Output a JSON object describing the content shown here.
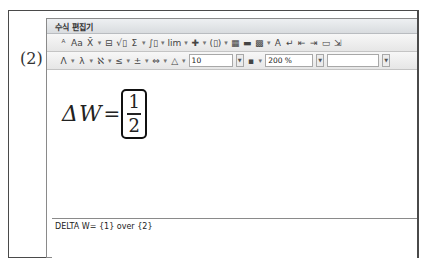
{
  "problem": {
    "label": "(2)"
  },
  "editor": {
    "title": "수식 편집기",
    "toolbar_row1": [
      {
        "name": "font-style-icon",
        "glyph": "ᴬ"
      },
      {
        "name": "text-mode-icon",
        "glyph": "Aa"
      },
      {
        "name": "decoration-icon",
        "glyph": "X̄"
      },
      {
        "name": "dropdown-arrow",
        "glyph": "▾"
      },
      {
        "name": "fraction-icon",
        "glyph": "⊟"
      },
      {
        "name": "root-icon",
        "glyph": "√▯"
      },
      {
        "name": "sum-icon",
        "glyph": "Σ"
      },
      {
        "name": "dropdown-arrow",
        "glyph": "▾"
      },
      {
        "name": "integral-icon",
        "glyph": "∫▯"
      },
      {
        "name": "dropdown-arrow",
        "glyph": "▾"
      },
      {
        "name": "limit-icon",
        "glyph": "lim"
      },
      {
        "name": "dropdown-arrow",
        "glyph": "▾"
      },
      {
        "name": "matrix-cross-icon",
        "glyph": "✚"
      },
      {
        "name": "dropdown-arrow",
        "glyph": "▾"
      },
      {
        "name": "bracket-icon",
        "glyph": "(▯)"
      },
      {
        "name": "dropdown-arrow",
        "glyph": "▾"
      },
      {
        "name": "matrix-icon",
        "glyph": "▦"
      },
      {
        "name": "align-icon",
        "glyph": "▬"
      },
      {
        "name": "grid-icon",
        "glyph": "▩"
      },
      {
        "name": "dropdown-arrow",
        "glyph": "▾"
      },
      {
        "name": "color-icon",
        "glyph": "A"
      },
      {
        "name": "enter-icon",
        "glyph": "↵"
      },
      {
        "name": "prev-icon",
        "glyph": "⇤"
      },
      {
        "name": "next-icon",
        "glyph": "⇥"
      },
      {
        "name": "open-icon",
        "glyph": "▭"
      },
      {
        "name": "insert-icon",
        "glyph": "⇲"
      }
    ],
    "toolbar_row2": [
      {
        "name": "greek-upper-icon",
        "glyph": "Λ"
      },
      {
        "name": "dropdown-arrow",
        "glyph": "▾"
      },
      {
        "name": "greek-lower-icon",
        "glyph": "λ"
      },
      {
        "name": "dropdown-arrow",
        "glyph": "▾"
      },
      {
        "name": "symbol-icon",
        "glyph": "ℵ"
      },
      {
        "name": "dropdown-arrow",
        "glyph": "▾"
      },
      {
        "name": "relation-icon",
        "glyph": "≤"
      },
      {
        "name": "dropdown-arrow",
        "glyph": "▾"
      },
      {
        "name": "operator-icon",
        "glyph": "±"
      },
      {
        "name": "dropdown-arrow",
        "glyph": "▾"
      },
      {
        "name": "arrow-icon",
        "glyph": "⇔"
      },
      {
        "name": "dropdown-arrow",
        "glyph": "▾"
      },
      {
        "name": "misc-icon",
        "glyph": "△"
      },
      {
        "name": "dropdown-arrow",
        "glyph": "▾"
      }
    ],
    "font_size": "10",
    "color_icon": "▪",
    "zoom": "200 %",
    "font_name": "",
    "formula": {
      "lhs": "ΔW",
      "equals": "=",
      "numerator": "1",
      "denominator": "2"
    },
    "script": "DELTA W= {1} over {2}"
  }
}
